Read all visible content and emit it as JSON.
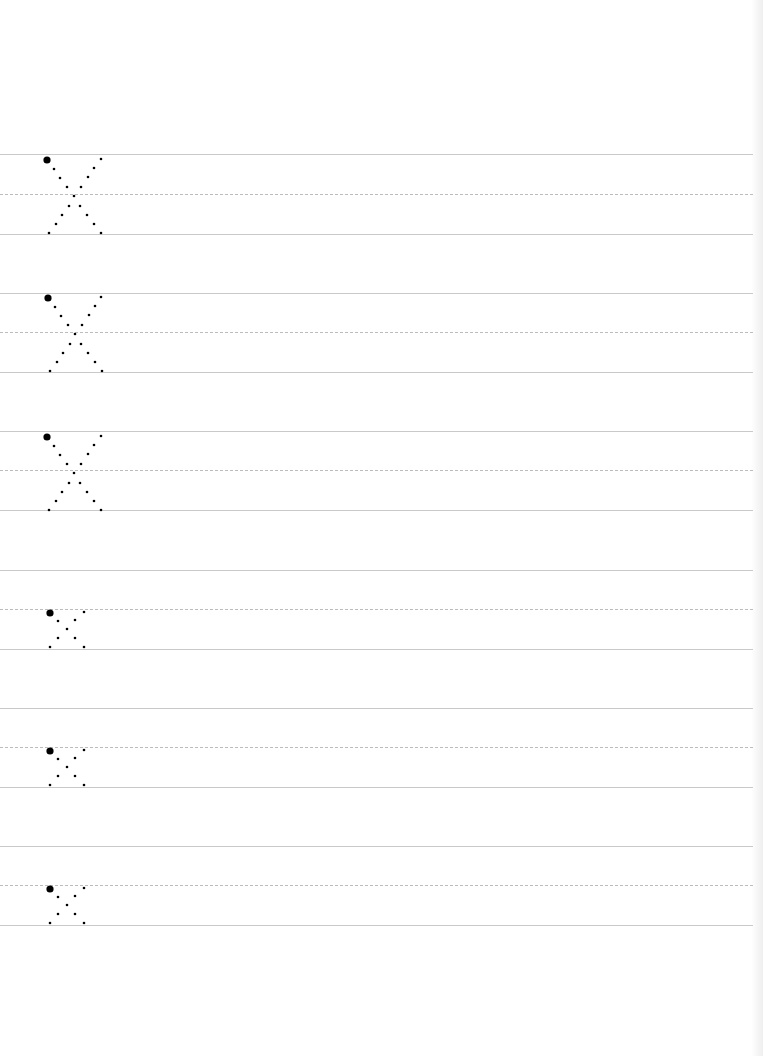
{
  "worksheet": {
    "type": "handwriting-practice",
    "letter": "X",
    "line_color": "#c9c9c9",
    "dash_color": "#bcbcbc",
    "dot_color": "#000000",
    "rows": [
      {
        "case": "uppercase",
        "glyph": "X",
        "top": 154,
        "mid": 194,
        "bottom": 234
      },
      {
        "case": "uppercase",
        "glyph": "X",
        "top": 293,
        "mid": 332,
        "bottom": 372
      },
      {
        "case": "uppercase",
        "glyph": "X",
        "top": 431,
        "mid": 470,
        "bottom": 510
      },
      {
        "case": "lowercase",
        "glyph": "x",
        "top": 570,
        "mid": 609,
        "bottom": 649
      },
      {
        "case": "lowercase",
        "glyph": "x",
        "top": 708,
        "mid": 747,
        "bottom": 787
      },
      {
        "case": "lowercase",
        "glyph": "x",
        "top": 846,
        "mid": 885,
        "bottom": 925
      }
    ]
  }
}
